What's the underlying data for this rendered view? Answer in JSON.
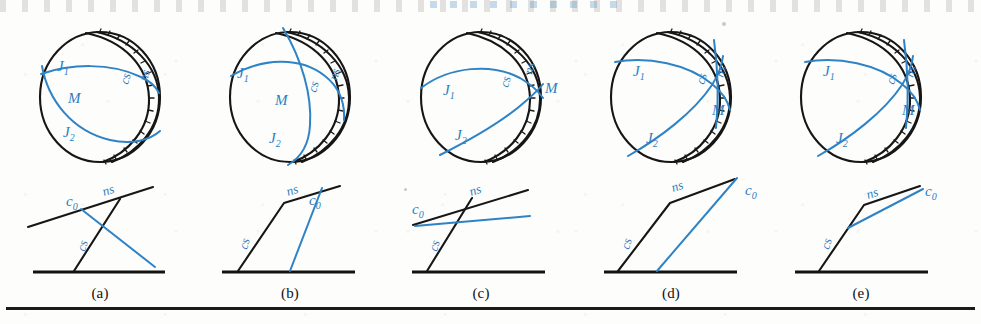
{
  "figure": {
    "kind": "scanned-textbook-figure",
    "panel_count": 5,
    "colors": {
      "blue": "#2e83c6",
      "black": "#161616",
      "paper": "#fdfdfc"
    },
    "bottom_rule": true
  },
  "captions": [
    {
      "label": "(a)",
      "x": 100
    },
    {
      "label": "(b)",
      "x": 290
    },
    {
      "label": "(c)",
      "x": 481
    },
    {
      "label": "(d)",
      "x": 671
    },
    {
      "label": "(e)",
      "x": 861
    }
  ],
  "panels": [
    {
      "id": "a",
      "caption": "(a)",
      "sphere": {
        "labels": {
          "j1": "J",
          "j1_sub": "1",
          "j2": "J",
          "j2_sub": "2",
          "m": "M",
          "cs": "cs",
          "ns": "ns"
        }
      },
      "lower": {
        "labels": {
          "c0": "c",
          "c0_sub": "0",
          "cs": "cs",
          "ns": "ns"
        }
      }
    },
    {
      "id": "b",
      "caption": "(b)",
      "sphere": {
        "labels": {
          "j1": "J",
          "j1_sub": "1",
          "j2": "J",
          "j2_sub": "2",
          "m": "M",
          "cs": "cs",
          "ns": "ns"
        }
      },
      "lower": {
        "labels": {
          "c0": "c",
          "c0_sub": "0",
          "cs": "cs",
          "ns": "ns"
        }
      }
    },
    {
      "id": "c",
      "caption": "(c)",
      "sphere": {
        "labels": {
          "j1": "J",
          "j1_sub": "1",
          "j2": "J",
          "j2_sub": "2",
          "m": "M",
          "cs": "cs",
          "ns": "ns"
        }
      },
      "lower": {
        "labels": {
          "c0": "c",
          "c0_sub": "0",
          "cs": "cs",
          "ns": "ns"
        }
      }
    },
    {
      "id": "d",
      "caption": "(d)",
      "sphere": {
        "labels": {
          "j1": "J",
          "j1_sub": "1",
          "j2": "J",
          "j2_sub": "2",
          "m": "M",
          "cs": "cs",
          "ns": "ns"
        }
      },
      "lower": {
        "labels": {
          "c0": "c",
          "c0_sub": "0",
          "cs": "cs",
          "ns": "ns"
        }
      }
    },
    {
      "id": "e",
      "caption": "(e)",
      "sphere": {
        "labels": {
          "j1": "J",
          "j1_sub": "1",
          "j2": "J",
          "j2_sub": "2",
          "m": "M",
          "cs": "cs",
          "ns": "ns"
        }
      },
      "lower": {
        "labels": {
          "c0": "c",
          "c0_sub": "0",
          "cs": "cs",
          "ns": "ns"
        }
      }
    }
  ]
}
